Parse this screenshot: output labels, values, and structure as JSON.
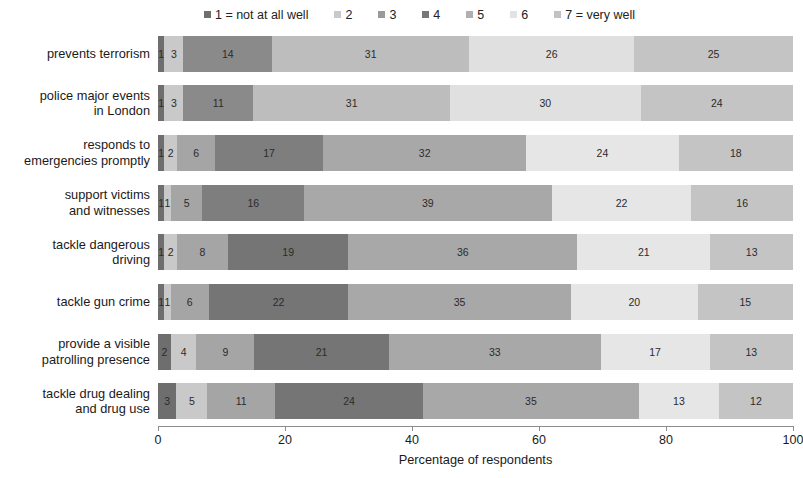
{
  "chart_data": {
    "type": "bar",
    "orientation": "horizontal",
    "stacked": true,
    "normalized": true,
    "title": "",
    "xlabel": "Percentage of respondents",
    "ylabel": "",
    "xlim": [
      0,
      100
    ],
    "xticks": [
      0,
      20,
      40,
      60,
      80,
      100
    ],
    "xtick_labels": [
      "0",
      "20",
      "40",
      "60",
      "80",
      "100"
    ],
    "grid": false,
    "legend_position": "top",
    "legend_entries": [
      "1 = not at all well",
      "2",
      "3",
      "4",
      "5",
      "6",
      "7 = very well"
    ],
    "series_colors": [
      "#6e6e6e",
      "#c9c9c9",
      "#9a9a9a",
      "#777777",
      "#b0b0b0",
      "#e3e3e3",
      "#c2c2c2"
    ],
    "categories": [
      "prevents terrorism",
      "police major events in London",
      "responds to emergencies promptly",
      "support victims and witnesses",
      "tackle dangerous driving",
      "tackle gun crime",
      "provide a visible patrolling presence",
      "tackle drug dealing and drug use"
    ],
    "category_label_lines": [
      [
        "prevents terrorism"
      ],
      [
        "police major events",
        "in London"
      ],
      [
        "responds to",
        "emergencies promptly"
      ],
      [
        "support victims",
        "and witnesses"
      ],
      [
        "tackle dangerous",
        "driving"
      ],
      [
        "tackle gun crime"
      ],
      [
        "provide a visible",
        "patrolling presence"
      ],
      [
        "tackle drug dealing",
        "and drug use"
      ]
    ],
    "series": [
      {
        "name": "1 = not at all well",
        "values": [
          1,
          1,
          1,
          1,
          1,
          1,
          2,
          3
        ]
      },
      {
        "name": "2",
        "values": [
          3,
          3,
          2,
          1,
          2,
          1,
          4,
          5
        ]
      },
      {
        "name": "3",
        "values": [
          14,
          11,
          6,
          5,
          8,
          6,
          9,
          11
        ]
      },
      {
        "name": "4",
        "values": [
          31,
          31,
          17,
          16,
          19,
          22,
          21,
          24
        ]
      },
      {
        "name": "5",
        "values": [
          26,
          30,
          32,
          39,
          36,
          35,
          33,
          35
        ]
      },
      {
        "name": "6",
        "values": [
          25,
          24,
          24,
          22,
          21,
          20,
          17,
          13
        ]
      },
      {
        "name": "7 = very well",
        "values": [
          0,
          0,
          18,
          16,
          13,
          15,
          13,
          12
        ]
      }
    ],
    "rows": [
      {
        "label_lines": [
          "prevents terrorism"
        ],
        "segments": [
          {
            "series": "1 = not at all well",
            "value": 1,
            "label": "1",
            "color": "#6e6e6e"
          },
          {
            "series": "2",
            "value": 3,
            "label": "3",
            "color": "#c9c9c9"
          },
          {
            "series": "3",
            "value": 14,
            "label": "14",
            "color": "#8a8a8a"
          },
          {
            "series": "4",
            "value": 31,
            "label": "31",
            "color": "#bdbdbd"
          },
          {
            "series": "5",
            "value": 26,
            "label": "26",
            "color": "#e0e0e0"
          },
          {
            "series": "6",
            "value": 25,
            "label": "25",
            "color": "#c4c4c4"
          }
        ]
      },
      {
        "label_lines": [
          "police major events",
          "in London"
        ],
        "segments": [
          {
            "series": "1 = not at all well",
            "value": 1,
            "label": "1",
            "color": "#6e6e6e"
          },
          {
            "series": "2",
            "value": 3,
            "label": "3",
            "color": "#c9c9c9"
          },
          {
            "series": "3",
            "value": 11,
            "label": "11",
            "color": "#8a8a8a"
          },
          {
            "series": "4",
            "value": 31,
            "label": "31",
            "color": "#bdbdbd"
          },
          {
            "series": "5",
            "value": 30,
            "label": "30",
            "color": "#e0e0e0"
          },
          {
            "series": "6",
            "value": 24,
            "label": "24",
            "color": "#c4c4c4"
          }
        ]
      },
      {
        "label_lines": [
          "responds to",
          "emergencies promptly"
        ],
        "segments": [
          {
            "series": "1 = not at all well",
            "value": 1,
            "label": "1",
            "color": "#6e6e6e"
          },
          {
            "series": "2",
            "value": 2,
            "label": "2",
            "color": "#c9c9c9"
          },
          {
            "series": "3",
            "value": 6,
            "label": "6",
            "color": "#a5a5a5"
          },
          {
            "series": "4",
            "value": 17,
            "label": "17",
            "color": "#7e7e7e"
          },
          {
            "series": "5",
            "value": 32,
            "label": "32",
            "color": "#a8a8a8"
          },
          {
            "series": "6",
            "value": 24,
            "label": "24",
            "color": "#e6e6e6"
          },
          {
            "series": "7 = very well",
            "value": 18,
            "label": "18",
            "color": "#c4c4c4"
          }
        ]
      },
      {
        "label_lines": [
          "support victims",
          "and witnesses"
        ],
        "segments": [
          {
            "series": "1 = not at all well",
            "value": 1,
            "label": "1",
            "color": "#6e6e6e"
          },
          {
            "series": "2",
            "value": 1,
            "label": "1",
            "color": "#c9c9c9"
          },
          {
            "series": "3",
            "value": 5,
            "label": "5",
            "color": "#a5a5a5"
          },
          {
            "series": "4",
            "value": 16,
            "label": "16",
            "color": "#7e7e7e"
          },
          {
            "series": "5",
            "value": 39,
            "label": "39",
            "color": "#a8a8a8"
          },
          {
            "series": "6",
            "value": 22,
            "label": "22",
            "color": "#e6e6e6"
          },
          {
            "series": "7 = very well",
            "value": 16,
            "label": "16",
            "color": "#c4c4c4"
          }
        ]
      },
      {
        "label_lines": [
          "tackle dangerous",
          "driving"
        ],
        "segments": [
          {
            "series": "1 = not at all well",
            "value": 1,
            "label": "1",
            "color": "#6e6e6e"
          },
          {
            "series": "2",
            "value": 2,
            "label": "2",
            "color": "#c9c9c9"
          },
          {
            "series": "3",
            "value": 8,
            "label": "8",
            "color": "#a5a5a5"
          },
          {
            "series": "4",
            "value": 19,
            "label": "19",
            "color": "#757575"
          },
          {
            "series": "5",
            "value": 36,
            "label": "36",
            "color": "#a8a8a8"
          },
          {
            "series": "6",
            "value": 21,
            "label": "21",
            "color": "#e6e6e6"
          },
          {
            "series": "7 = very well",
            "value": 13,
            "label": "13",
            "color": "#c4c4c4"
          }
        ]
      },
      {
        "label_lines": [
          "tackle gun crime"
        ],
        "segments": [
          {
            "series": "1 = not at all well",
            "value": 1,
            "label": "1",
            "color": "#6e6e6e"
          },
          {
            "series": "2",
            "value": 1,
            "label": "1",
            "color": "#c9c9c9"
          },
          {
            "series": "3",
            "value": 6,
            "label": "6",
            "color": "#a5a5a5"
          },
          {
            "series": "4",
            "value": 22,
            "label": "22",
            "color": "#757575"
          },
          {
            "series": "5",
            "value": 35,
            "label": "35",
            "color": "#a8a8a8"
          },
          {
            "series": "6",
            "value": 20,
            "label": "20",
            "color": "#e6e6e6"
          },
          {
            "series": "7 = very well",
            "value": 15,
            "label": "15",
            "color": "#c4c4c4"
          }
        ]
      },
      {
        "label_lines": [
          "provide a visible",
          "patrolling presence"
        ],
        "segments": [
          {
            "series": "1 = not at all well",
            "value": 2,
            "label": "2",
            "color": "#6e6e6e"
          },
          {
            "series": "2",
            "value": 4,
            "label": "4",
            "color": "#c9c9c9"
          },
          {
            "series": "3",
            "value": 9,
            "label": "9",
            "color": "#a5a5a5"
          },
          {
            "series": "4",
            "value": 21,
            "label": "21",
            "color": "#757575"
          },
          {
            "series": "5",
            "value": 33,
            "label": "33",
            "color": "#a8a8a8"
          },
          {
            "series": "6",
            "value": 17,
            "label": "17",
            "color": "#e6e6e6"
          },
          {
            "series": "7 = very well",
            "value": 13,
            "label": "13",
            "color": "#c4c4c4"
          }
        ]
      },
      {
        "label_lines": [
          "tackle drug dealing",
          "and drug use"
        ],
        "segments": [
          {
            "series": "1 = not at all well",
            "value": 3,
            "label": "3",
            "color": "#6e6e6e"
          },
          {
            "series": "2",
            "value": 5,
            "label": "5",
            "color": "#c9c9c9"
          },
          {
            "series": "3",
            "value": 11,
            "label": "11",
            "color": "#a5a5a5"
          },
          {
            "series": "4",
            "value": 24,
            "label": "24",
            "color": "#757575"
          },
          {
            "series": "5",
            "value": 35,
            "label": "35",
            "color": "#a8a8a8"
          },
          {
            "series": "6",
            "value": 13,
            "label": "13",
            "color": "#e6e6e6"
          },
          {
            "series": "7 = very well",
            "value": 12,
            "label": "12",
            "color": "#c4c4c4"
          }
        ]
      }
    ]
  }
}
